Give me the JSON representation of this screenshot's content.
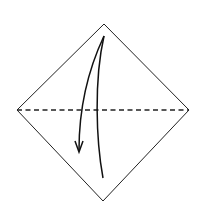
{
  "diagram": {
    "type": "origami-fold-step",
    "elements": {
      "paper": {
        "shape": "diamond",
        "stroke": "#222222",
        "fill": "#ffffff"
      },
      "fold_line": {
        "style": "dashed",
        "fold_type": "valley",
        "orientation": "horizontal",
        "stroke": "#222222"
      },
      "arrow": {
        "direction": "down",
        "meaning": "fold top corner down",
        "stroke": "#111111"
      }
    }
  }
}
